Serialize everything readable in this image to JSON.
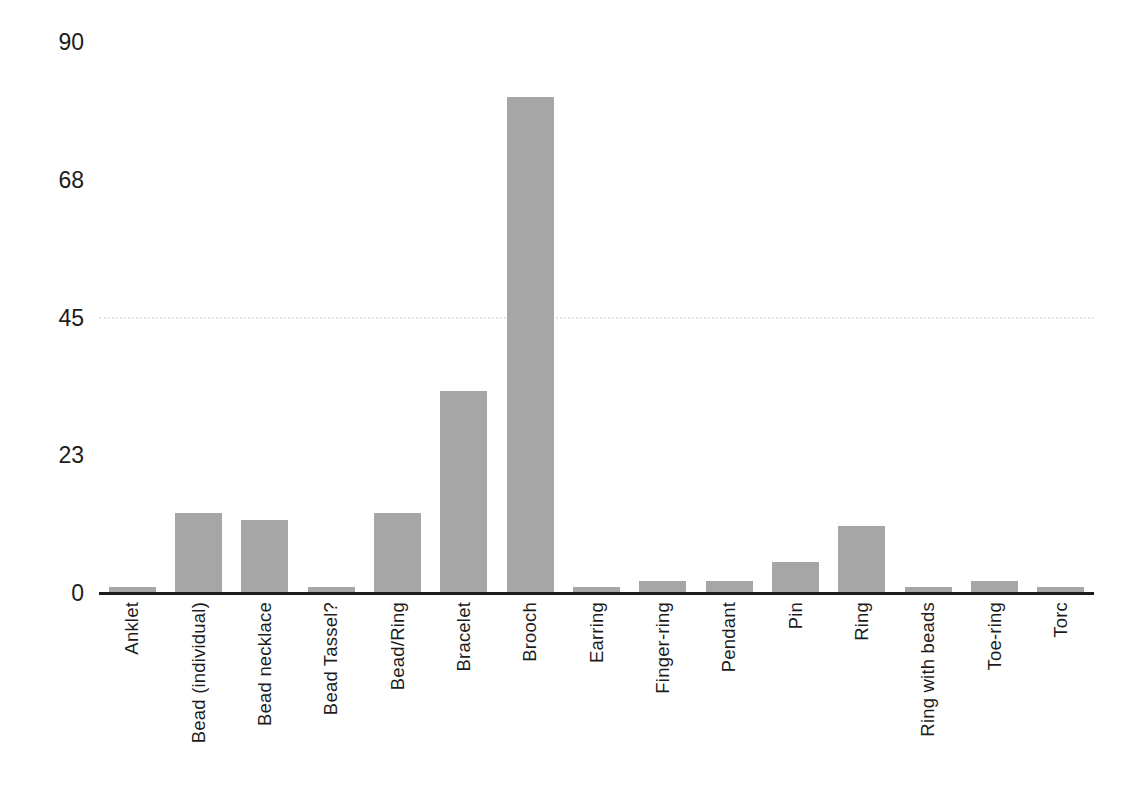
{
  "chart_data": {
    "type": "bar",
    "title": "",
    "xlabel": "",
    "ylabel": "",
    "categories": [
      "Anklet",
      "Bead (individual)",
      "Bead necklace",
      "Bead Tassel?",
      "Bead/Ring",
      "Bracelet",
      "Brooch",
      "Earring",
      "Finger-ring",
      "Pendant",
      "Pin",
      "Ring",
      "Ring with beads",
      "Toe-ring",
      "Torc"
    ],
    "values": [
      1,
      13,
      12,
      1,
      13,
      33,
      81,
      1,
      2,
      2,
      5,
      11,
      1,
      2,
      1
    ],
    "ylim": [
      0,
      90
    ],
    "yticks": [
      {
        "label": "0",
        "pos": 0
      },
      {
        "label": "23",
        "pos": 22.5
      },
      {
        "label": "45",
        "pos": 45
      },
      {
        "label": "68",
        "pos": 67.5
      },
      {
        "label": "90",
        "pos": 90
      }
    ],
    "legend": "none",
    "grid": "single faint horizontal gridline at 45",
    "gridline_at": 45,
    "bar_color": "#a6a6a6",
    "axis_color": "#1b1b1b",
    "text_color": "#1c1c1c",
    "gridline_color": "#e4e4e4",
    "background_color": "#ffffff"
  }
}
